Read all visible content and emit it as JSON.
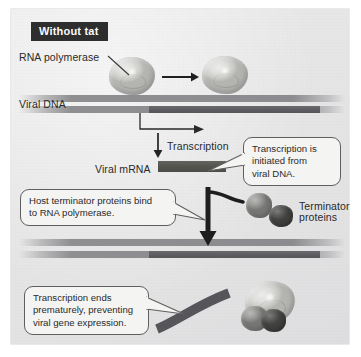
{
  "figure": {
    "title": "Without tat",
    "background_color": "#e6e6e7",
    "frame_color": "#ffffff"
  },
  "labels": {
    "rna_polymerase": "RNA polymerase",
    "viral_dna": "Viral DNA",
    "viral_mrna": "Viral mRNA",
    "transcription": "Transcription",
    "terminator_proteins_line1": "Terminator",
    "terminator_proteins_line2": "proteins"
  },
  "callouts": {
    "initiation": {
      "line1": "Transcription is",
      "line2": "initiated from",
      "line3": "viral DNA."
    },
    "terminator_binding": {
      "line1": "Host terminator proteins bind",
      "line2": "to RNA polymerase."
    },
    "premature_end": {
      "line1": "Transcription ends",
      "line2": "prematurely, preventing",
      "line3": "viral gene expression."
    }
  },
  "colors": {
    "title_chip_bg": "#2e2e2e",
    "title_chip_text": "#fafafa",
    "dna_strand": "#8c8c90",
    "dna_gene_segment": "#5d5d61",
    "mrna": "#54544f",
    "polymerase": "#dedede",
    "terminator_protein_light": "#a2a2a0",
    "terminator_protein_dark": "#626260",
    "callout_bg": "#f4f4f3",
    "callout_border": "#5f5f5f",
    "arrow": "#2a2a2a",
    "text": "#2a2a2a"
  },
  "diagram_elements": {
    "polymerase_count_top": 2,
    "terminator_protein_count": 2,
    "dna_strand_count_top": 2,
    "dna_strand_count_bottom": 2,
    "movement_arrow_direction": "right",
    "transcription_arrow_direction": "down",
    "process_arrow_direction": "down"
  }
}
